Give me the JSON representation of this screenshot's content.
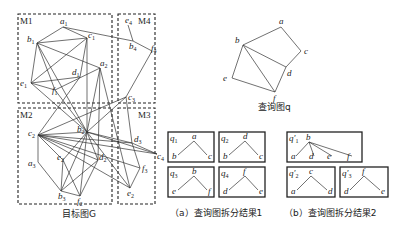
{
  "figure": {
    "target_graph": {
      "caption": "目标图G",
      "regions": [
        {
          "id": "M1",
          "label": "M1"
        },
        {
          "id": "M2",
          "label": "M2"
        },
        {
          "id": "M3",
          "label": "M3"
        },
        {
          "id": "M4",
          "label": "M4"
        }
      ],
      "nodes": [
        {
          "id": "a1",
          "base": "a",
          "sub": "1",
          "x": 63,
          "y": 27
        },
        {
          "id": "b1",
          "base": "b",
          "sub": "1",
          "x": 37,
          "y": 43
        },
        {
          "id": "c1",
          "base": "c",
          "sub": "1",
          "x": 87,
          "y": 38
        },
        {
          "id": "d1",
          "base": "d",
          "sub": "1",
          "x": 80,
          "y": 77
        },
        {
          "id": "a2",
          "base": "a",
          "sub": "2",
          "x": 100,
          "y": 68
        },
        {
          "id": "e1",
          "base": "e",
          "sub": "1",
          "x": 31,
          "y": 83
        },
        {
          "id": "f1",
          "base": "f",
          "sub": "1",
          "x": 55,
          "y": 90
        },
        {
          "id": "e4",
          "base": "e",
          "sub": "4",
          "x": 128,
          "y": 25
        },
        {
          "id": "b4",
          "base": "b",
          "sub": "4",
          "x": 133,
          "y": 41
        },
        {
          "id": "f4",
          "base": "f",
          "sub": "4",
          "x": 152,
          "y": 51
        },
        {
          "id": "c3",
          "base": "c",
          "sub": "3",
          "x": 126,
          "y": 97
        },
        {
          "id": "c2",
          "base": "c",
          "sub": "2",
          "x": 38,
          "y": 135
        },
        {
          "id": "b2",
          "base": "b",
          "sub": "2",
          "x": 87,
          "y": 132
        },
        {
          "id": "e2",
          "base": "e",
          "sub": "2",
          "x": 63,
          "y": 160
        },
        {
          "id": "d2",
          "base": "d",
          "sub": "2",
          "x": 98,
          "y": 160
        },
        {
          "id": "a3",
          "base": "a",
          "sub": "3",
          "x": 38,
          "y": 162
        },
        {
          "id": "b3",
          "base": "b",
          "sub": "3",
          "x": 61,
          "y": 191
        },
        {
          "id": "f2",
          "base": "f",
          "sub": "2",
          "x": 80,
          "y": 196
        },
        {
          "id": "d3",
          "base": "d",
          "sub": "3",
          "x": 132,
          "y": 143
        },
        {
          "id": "c4",
          "base": "c",
          "sub": "4",
          "x": 157,
          "y": 154
        },
        {
          "id": "f3",
          "base": "f",
          "sub": "3",
          "x": 140,
          "y": 168
        },
        {
          "id": "e2b",
          "base": "e",
          "sub": "2",
          "x": 130,
          "y": 188
        }
      ],
      "edges": [
        [
          "a1",
          "b1"
        ],
        [
          "a1",
          "c1"
        ],
        [
          "a1",
          "b4"
        ],
        [
          "b1",
          "c1"
        ],
        [
          "b1",
          "e1"
        ],
        [
          "b1",
          "a2"
        ],
        [
          "b1",
          "f1"
        ],
        [
          "b1",
          "b2"
        ],
        [
          "c1",
          "e1"
        ],
        [
          "c1",
          "d1"
        ],
        [
          "c1",
          "b2"
        ],
        [
          "e1",
          "f1"
        ],
        [
          "e1",
          "d1"
        ],
        [
          "f1",
          "a2"
        ],
        [
          "d1",
          "c2"
        ],
        [
          "a2",
          "b2"
        ],
        [
          "a2",
          "d2"
        ],
        [
          "a2",
          "e2b"
        ],
        [
          "b4",
          "e4"
        ],
        [
          "b4",
          "f4"
        ],
        [
          "f4",
          "c3"
        ],
        [
          "c3",
          "b2"
        ],
        [
          "c3",
          "d3"
        ],
        [
          "c3",
          "c2"
        ],
        [
          "f1",
          "b2"
        ],
        [
          "e1",
          "b2"
        ],
        [
          "c2",
          "b2"
        ],
        [
          "c2",
          "a3"
        ],
        [
          "c2",
          "e2"
        ],
        [
          "c2",
          "d2"
        ],
        [
          "c2",
          "d3"
        ],
        [
          "c2",
          "c4"
        ],
        [
          "c2",
          "f3"
        ],
        [
          "b2",
          "e2"
        ],
        [
          "b2",
          "d2"
        ],
        [
          "b2",
          "f2"
        ],
        [
          "b2",
          "b3"
        ],
        [
          "b2",
          "d3"
        ],
        [
          "b2",
          "e2b"
        ],
        [
          "b2",
          "c4"
        ],
        [
          "a3",
          "b3"
        ],
        [
          "e2",
          "b3"
        ],
        [
          "e2",
          "f2"
        ],
        [
          "d2",
          "b3"
        ],
        [
          "d2",
          "f2"
        ],
        [
          "b3",
          "f2"
        ],
        [
          "d3",
          "c4"
        ],
        [
          "d3",
          "f3"
        ],
        [
          "f3",
          "e2b"
        ],
        [
          "c2",
          "e2b"
        ]
      ]
    },
    "query_graph": {
      "caption": "查询图q",
      "nodes": [
        {
          "id": "a",
          "x": 281,
          "y": 27
        },
        {
          "id": "b",
          "x": 243,
          "y": 45
        },
        {
          "id": "c",
          "x": 301,
          "y": 51
        },
        {
          "id": "d",
          "x": 286,
          "y": 67
        },
        {
          "id": "e",
          "x": 232,
          "y": 78
        },
        {
          "id": "f",
          "x": 275,
          "y": 92
        }
      ],
      "edges": [
        [
          "a",
          "b"
        ],
        [
          "a",
          "c"
        ],
        [
          "c",
          "d"
        ],
        [
          "b",
          "d"
        ],
        [
          "b",
          "e"
        ],
        [
          "b",
          "f"
        ],
        [
          "e",
          "f"
        ],
        [
          "d",
          "f"
        ]
      ]
    },
    "decomposition_1": {
      "caption": "（a）查询图拆分结果1",
      "parts": [
        {
          "label": "q",
          "sub": "1",
          "root": "a",
          "leaves": [
            "b",
            "c"
          ]
        },
        {
          "label": "q",
          "sub": "2",
          "root": "d",
          "leaves": [
            "b",
            "c"
          ]
        },
        {
          "label": "q",
          "sub": "3",
          "root": "b",
          "leaves": [
            "e",
            "f"
          ]
        },
        {
          "label": "q",
          "sub": "4",
          "root": "f",
          "leaves": [
            "d",
            "e"
          ]
        }
      ]
    },
    "decomposition_2": {
      "caption": "（b）查询图拆分结果2",
      "parts": [
        {
          "label": "q′",
          "sub": "1",
          "root": "b",
          "leaves": [
            "a",
            "d",
            "e",
            "f"
          ]
        },
        {
          "label": "q′",
          "sub": "2",
          "root": "c",
          "leaves": [
            "a",
            "d"
          ]
        },
        {
          "label": "q′",
          "sub": "3",
          "root": "f",
          "leaves": [
            "d",
            "e"
          ]
        }
      ]
    }
  }
}
